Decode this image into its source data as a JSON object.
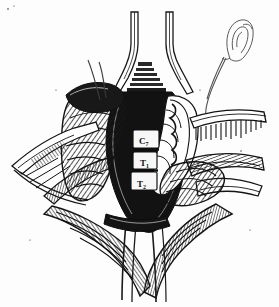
{
  "figure": {
    "medium": "pen-and-ink line drawing",
    "background_color": "#fdfdfd",
    "ink_color": "#111111",
    "width": 279,
    "height": 307
  },
  "labels": {
    "vertebrae": [
      {
        "id": "c7",
        "main": "C",
        "sub": "7",
        "text": "C7",
        "x": 140,
        "y": 142,
        "box": {
          "x": 134,
          "y": 131,
          "w": 24,
          "h": 16
        }
      },
      {
        "id": "t1",
        "main": "T",
        "sub": "1",
        "text": "T1",
        "x": 140,
        "y": 164,
        "box": {
          "x": 134,
          "y": 153,
          "w": 22,
          "h": 15
        }
      },
      {
        "id": "t2",
        "main": "T",
        "sub": "2",
        "text": "T2",
        "x": 138,
        "y": 185,
        "box": {
          "x": 132,
          "y": 173,
          "w": 24,
          "h": 16
        }
      }
    ]
  },
  "anatomy": {
    "ear": {
      "name": "ear-outline",
      "description": "right ear drawn for orientation",
      "x": 235,
      "y": 42
    },
    "neck_contour": {
      "name": "neck-contour-line",
      "description": "thin curve from ear down the lateral neck"
    },
    "wound_cavity": {
      "name": "wound-cavity",
      "description": "deep dark prevertebral cavity"
    },
    "vertebral_bodies": {
      "name": "vertebral-bodies",
      "description": "three exposed vertebral bodies labelled C7, T1, T2"
    },
    "trachea_esophagus": {
      "name": "trachea-esophagus-retracted",
      "description": "midline structures retracted superiorly between blades"
    },
    "carotid_sheath": {
      "name": "carotid-sheath",
      "description": "vascular bundle retracted laterally on the right"
    },
    "muscle_flaps": {
      "name": "muscle-flaps",
      "description": "hatched strap muscle and platysma flaps"
    },
    "suture_loop": {
      "name": "suture-loop",
      "description": "thin curved suture/nerve strand over the upper left flap"
    }
  },
  "instruments": {
    "retractors": [
      {
        "name": "retractor-blade-superior-left",
        "position": "top-center-left"
      },
      {
        "name": "retractor-blade-superior-right",
        "position": "top-center-right"
      },
      {
        "name": "retractor-blade-left",
        "position": "left-lateral"
      },
      {
        "name": "retractor-blade-right-upper",
        "position": "right-upper-lateral"
      },
      {
        "name": "retractor-blade-right-lower",
        "position": "right-lower-lateral"
      },
      {
        "name": "retractor-blade-inferior",
        "position": "bottom-center"
      }
    ]
  }
}
